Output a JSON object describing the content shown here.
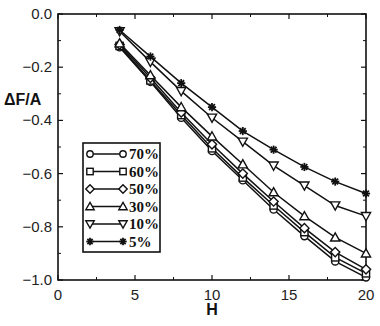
{
  "chart_data": {
    "type": "line",
    "title": "",
    "xlabel": "H",
    "ylabel": "ΔF/A",
    "xlim": [
      0,
      20
    ],
    "ylim": [
      -1.0,
      0.0
    ],
    "xticks": [
      0,
      5,
      10,
      15,
      20
    ],
    "xtick_labels": [
      "0",
      "5",
      "10",
      "15",
      "20"
    ],
    "yticks": [
      0.0,
      -0.2,
      -0.4,
      -0.6,
      -0.8,
      -1.0
    ],
    "ytick_labels": [
      "0.0",
      "−0.2",
      "−0.4",
      "−0.6",
      "−0.8",
      "−1.0"
    ],
    "grid": false,
    "legend_position": "lower left (inside)",
    "x": [
      4,
      6,
      8,
      10,
      12,
      14,
      16,
      18,
      20
    ],
    "series": [
      {
        "name": "70%",
        "marker": "circle",
        "values": [
          -0.125,
          -0.255,
          -0.39,
          -0.515,
          -0.625,
          -0.735,
          -0.835,
          -0.93,
          -0.99
        ]
      },
      {
        "name": "60%",
        "marker": "square",
        "values": [
          -0.12,
          -0.25,
          -0.38,
          -0.505,
          -0.615,
          -0.72,
          -0.82,
          -0.915,
          -0.975
        ]
      },
      {
        "name": "50%",
        "marker": "diamond",
        "values": [
          -0.115,
          -0.24,
          -0.37,
          -0.49,
          -0.6,
          -0.705,
          -0.805,
          -0.895,
          -0.96
        ]
      },
      {
        "name": "30%",
        "marker": "triangle-up",
        "values": [
          -0.11,
          -0.23,
          -0.35,
          -0.46,
          -0.565,
          -0.67,
          -0.76,
          -0.84,
          -0.9
        ]
      },
      {
        "name": "10%",
        "marker": "triangle-down",
        "values": [
          -0.065,
          -0.18,
          -0.29,
          -0.39,
          -0.48,
          -0.57,
          -0.645,
          -0.72,
          -0.76
        ]
      },
      {
        "name": "5%",
        "marker": "asterisk",
        "values": [
          -0.06,
          -0.16,
          -0.26,
          -0.35,
          -0.44,
          -0.51,
          -0.575,
          -0.63,
          -0.675
        ]
      }
    ]
  },
  "legend": {
    "items": [
      "70%",
      "60%",
      "50%",
      "30%",
      "10%",
      "5%"
    ]
  },
  "axes": {
    "x_title": "H",
    "y_title": "ΔF/A"
  }
}
